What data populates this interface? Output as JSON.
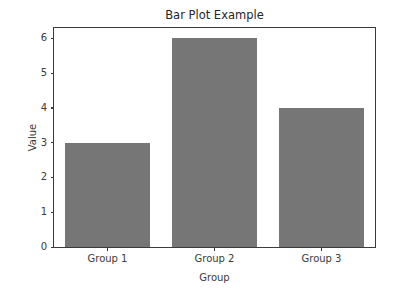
{
  "chart_data": {
    "type": "bar",
    "title": "Bar Plot Example",
    "xlabel": "Group",
    "ylabel": "Value",
    "categories": [
      "Group 1",
      "Group 2",
      "Group 3"
    ],
    "values": [
      3,
      6,
      4
    ],
    "ylim": [
      0,
      6.3
    ],
    "yticks": [
      0,
      1,
      2,
      3,
      4,
      5,
      6
    ],
    "ytick_labels": [
      "0",
      "1",
      "2",
      "3",
      "4",
      "5",
      "6"
    ],
    "xtick_labels": [
      "Group 1",
      "Group 2",
      "Group 3"
    ],
    "grid": false,
    "legend": null,
    "bar_color": "#767676",
    "axis_color": "#3b3b3b",
    "background_color": "#ffffff",
    "bar_width_ratio": 0.8
  }
}
